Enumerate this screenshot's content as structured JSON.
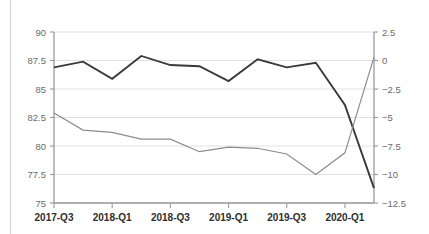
{
  "chart_data": {
    "type": "line",
    "title": "",
    "subtitle": "",
    "xlabel": "",
    "ylabel": "",
    "y2label": "",
    "grid": true,
    "legend": "none",
    "x": [
      "2017-Q3",
      "2017-Q4",
      "2018-Q1",
      "2018-Q2",
      "2018-Q3",
      "2018-Q4",
      "2019-Q1",
      "2019-Q2",
      "2019-Q3",
      "2019-Q4",
      "2020-Q1",
      "2020-Q2"
    ],
    "xtick_labels": [
      "2017-Q3",
      "2018-Q1",
      "2018-Q3",
      "2019-Q1",
      "2019-Q3",
      "2020-Q1"
    ],
    "xtick_indices": [
      0,
      2,
      4,
      6,
      8,
      10
    ],
    "ylim": [
      75,
      90
    ],
    "ytick_labels": [
      "90",
      "87.5",
      "85",
      "82.5",
      "80",
      "77.5",
      "75"
    ],
    "ytick_values": [
      90,
      87.5,
      85,
      82.5,
      80,
      77.5,
      75
    ],
    "y2lim": [
      -12.5,
      2.5
    ],
    "y2tick_labels": [
      "2.5",
      "0",
      "−2.5",
      "−5",
      "−7.5",
      "−10",
      "−12.5"
    ],
    "y2tick_values": [
      2.5,
      0,
      -2.5,
      -5,
      -7.5,
      -10,
      -12.5
    ],
    "series": [
      {
        "name": "primary-level",
        "axis": "left",
        "color": "#3a3a3a",
        "values": [
          86.9,
          87.4,
          85.9,
          87.9,
          87.1,
          87.0,
          85.7,
          87.6,
          86.9,
          87.3,
          83.6,
          76.3
        ]
      },
      {
        "name": "secondary-rate",
        "axis": "right",
        "color": "#8c8c8c",
        "values": [
          82.9,
          81.4,
          81.2,
          80.6,
          80.6,
          79.5,
          79.9,
          79.8,
          79.3,
          77.5,
          79.4,
          87.8
        ]
      }
    ]
  }
}
